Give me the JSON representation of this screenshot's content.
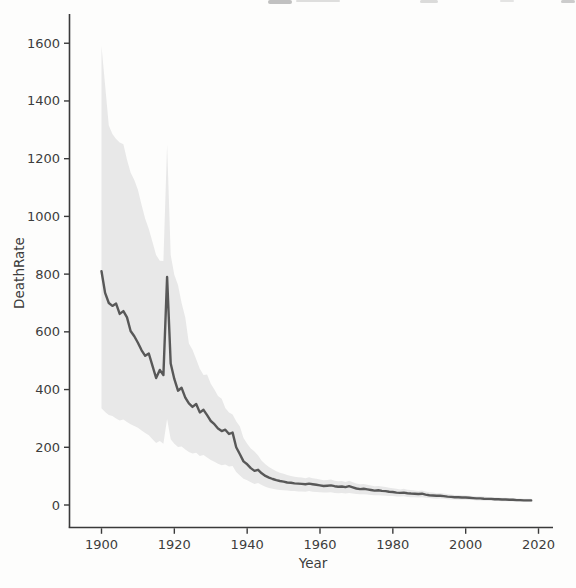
{
  "colors": {
    "background": "#fdfdfc",
    "axis": "#3a3a3a",
    "text": "#3d3d3d",
    "line": "#585858",
    "band": "#e8e8e8"
  },
  "chart_data": {
    "type": "line",
    "title": "",
    "xlabel": "Year",
    "ylabel": "DeathRate",
    "grid": false,
    "legend": "none",
    "x_ticks": [
      1900,
      1920,
      1940,
      1960,
      1980,
      2000,
      2020
    ],
    "y_ticks": [
      0,
      200,
      400,
      600,
      800,
      1000,
      1200,
      1400,
      1600
    ],
    "xlim": [
      1891,
      2024
    ],
    "ylim": [
      -75,
      1700
    ],
    "x": [
      1900,
      1901,
      1902,
      1903,
      1904,
      1905,
      1906,
      1907,
      1908,
      1909,
      1910,
      1911,
      1912,
      1913,
      1914,
      1915,
      1916,
      1917,
      1918,
      1919,
      1920,
      1921,
      1922,
      1923,
      1924,
      1925,
      1926,
      1927,
      1928,
      1929,
      1930,
      1931,
      1932,
      1933,
      1934,
      1935,
      1936,
      1937,
      1938,
      1939,
      1940,
      1941,
      1942,
      1943,
      1944,
      1945,
      1946,
      1947,
      1948,
      1949,
      1950,
      1951,
      1952,
      1953,
      1954,
      1955,
      1956,
      1957,
      1958,
      1959,
      1960,
      1961,
      1962,
      1963,
      1964,
      1965,
      1966,
      1967,
      1968,
      1969,
      1970,
      1971,
      1972,
      1973,
      1974,
      1975,
      1976,
      1977,
      1978,
      1979,
      1980,
      1981,
      1982,
      1983,
      1984,
      1985,
      1986,
      1987,
      1988,
      1989,
      1990,
      1991,
      1992,
      1993,
      1994,
      1995,
      1996,
      1997,
      1998,
      1999,
      2000,
      2001,
      2002,
      2003,
      2004,
      2005,
      2006,
      2007,
      2008,
      2009,
      2010,
      2011,
      2012,
      2013,
      2014,
      2015,
      2016,
      2017,
      2018
    ],
    "series": [
      {
        "name": "DeathRate (mean)",
        "values": [
          810,
          735,
          700,
          690,
          698,
          662,
          672,
          650,
          603,
          585,
          562,
          536,
          517,
          525,
          482,
          440,
          468,
          450,
          790,
          490,
          437,
          396,
          406,
          372,
          352,
          340,
          350,
          321,
          330,
          311,
          291,
          280,
          265,
          256,
          261,
          246,
          251,
          200,
          176,
          151,
          141,
          128,
          118,
          122,
          110,
          101,
          95,
          90,
          86,
          83,
          81,
          78,
          77,
          75,
          74,
          73,
          72,
          74,
          72,
          70,
          68,
          66,
          67,
          68,
          65,
          63,
          64,
          62,
          65,
          61,
          57,
          55,
          56,
          54,
          52,
          50,
          51,
          49,
          48,
          46,
          45,
          43,
          42,
          43,
          41,
          40,
          39,
          38,
          39,
          36,
          34,
          33,
          32,
          32,
          31,
          29,
          28,
          27,
          27,
          26,
          26,
          25,
          24,
          23,
          23,
          22,
          21,
          21,
          20,
          20,
          19,
          19,
          18,
          18,
          17,
          17,
          16,
          16,
          16
        ]
      }
    ],
    "ci_band": {
      "label": "confidence interval",
      "high": [
        1590,
        1455,
        1315,
        1285,
        1268,
        1256,
        1250,
        1196,
        1152,
        1126,
        1092,
        1040,
        992,
        956,
        911,
        866,
        846,
        845,
        1250,
        866,
        798,
        762,
        700,
        650,
        560,
        538,
        505,
        472,
        450,
        452,
        420,
        400,
        378,
        368,
        336,
        320,
        314,
        290,
        272,
        232,
        212,
        196,
        185,
        172,
        153,
        141,
        132,
        124,
        117,
        112,
        108,
        104,
        101,
        98,
        96,
        95,
        93,
        96,
        93,
        91,
        88,
        86,
        87,
        88,
        84,
        82,
        83,
        80,
        84,
        79,
        74,
        72,
        73,
        70,
        68,
        65,
        66,
        64,
        62,
        60,
        58,
        56,
        54,
        56,
        53,
        52,
        50,
        49,
        50,
        47,
        44,
        43,
        41,
        42,
        40,
        38,
        36,
        35,
        35,
        34,
        33,
        32,
        31,
        30,
        30,
        29,
        28,
        27,
        27,
        26,
        25,
        25,
        24,
        24,
        23,
        23,
        22,
        22,
        22
      ],
      "low": [
        335,
        322,
        312,
        308,
        300,
        293,
        296,
        288,
        280,
        274,
        268,
        258,
        250,
        242,
        228,
        215,
        222,
        212,
        298,
        228,
        212,
        201,
        203,
        192,
        184,
        178,
        181,
        170,
        173,
        165,
        156,
        150,
        143,
        138,
        140,
        133,
        135,
        114,
        102,
        91,
        86,
        79,
        73,
        76,
        69,
        63,
        59,
        56,
        54,
        52,
        51,
        50,
        49,
        48,
        47,
        47,
        46,
        48,
        46,
        45,
        44,
        43,
        43,
        44,
        42,
        41,
        42,
        40,
        42,
        40,
        38,
        37,
        37,
        36,
        35,
        34,
        34,
        33,
        32,
        31,
        31,
        29,
        29,
        30,
        28,
        27,
        27,
        26,
        27,
        25,
        24,
        23,
        22,
        23,
        22,
        20,
        19,
        19,
        18,
        18,
        18,
        17,
        17,
        16,
        16,
        15,
        15,
        14,
        14,
        14,
        13,
        13,
        13,
        12,
        12,
        11,
        11,
        10,
        10
      ]
    }
  }
}
